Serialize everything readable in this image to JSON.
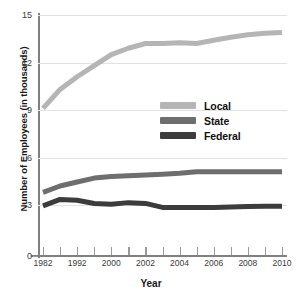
{
  "chart_data": {
    "type": "line",
    "title": "",
    "xlabel": "Year",
    "ylabel": "Number of Employees (in thousands)",
    "x": [
      1982,
      1987,
      1992,
      1996,
      2000,
      2001,
      2002,
      2003,
      2004,
      2005,
      2006,
      2007,
      2008,
      2009,
      2010
    ],
    "xlim": [
      1982,
      2010
    ],
    "ylim": [
      0,
      15
    ],
    "ytick_values": [
      0,
      3,
      6,
      9,
      12,
      15
    ],
    "ytick_labels": [
      "0",
      "3",
      "6",
      "9",
      "12",
      "15"
    ],
    "xtick_values": [
      1982,
      1987,
      1992,
      1996,
      2000,
      2001,
      2002,
      2003,
      2004,
      2005,
      2006,
      2007,
      2008,
      2009,
      2010
    ],
    "xtick_labels": [
      "1982",
      "",
      "1992",
      "",
      "2000",
      "",
      "2002",
      "",
      "2004",
      "",
      "2006",
      "",
      "2008",
      "",
      "2010"
    ],
    "grid": true,
    "legend_position": "center-right",
    "series": [
      {
        "name": "Local",
        "color": "#b5b5b5",
        "values": [
          9.1,
          10.3,
          11.1,
          11.8,
          12.5,
          12.9,
          13.2,
          13.2,
          13.25,
          13.2,
          13.4,
          13.6,
          13.75,
          13.85,
          13.9
        ]
      },
      {
        "name": "State",
        "color": "#6e6e6e",
        "values": [
          3.8,
          4.2,
          4.45,
          4.7,
          4.8,
          4.85,
          4.9,
          4.95,
          5.0,
          5.1,
          5.1,
          5.1,
          5.1,
          5.1,
          5.1
        ]
      },
      {
        "name": "Federal",
        "color": "#3c3c3c",
        "values": [
          2.95,
          3.35,
          3.3,
          3.1,
          3.05,
          3.15,
          3.1,
          2.85,
          2.85,
          2.85,
          2.85,
          2.88,
          2.9,
          2.92,
          2.92
        ]
      }
    ]
  },
  "legend": {
    "items": [
      {
        "label": "Local",
        "color": "#b5b5b5"
      },
      {
        "label": "State",
        "color": "#6e6e6e"
      },
      {
        "label": "Federal",
        "color": "#3c3c3c"
      }
    ]
  },
  "axes": {
    "x_title": "Year",
    "y_title": "Number of Employees (in thousands)"
  }
}
